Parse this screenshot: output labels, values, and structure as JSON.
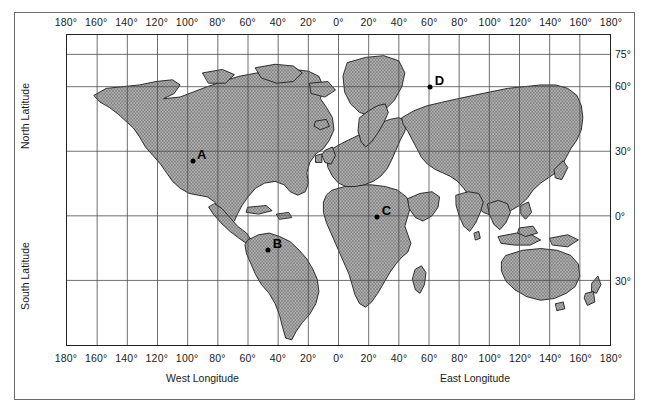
{
  "figure": {
    "type": "world-map",
    "projection": "equirectangular",
    "background_color": "#ffffff",
    "land_fill_color": "#9a9a9a",
    "land_outline_color": "#1a1a1a",
    "grid_color": "#4d4d4d",
    "frame_color": "#6b6b6b"
  },
  "axes": {
    "x": {
      "west_title": "West Longitude",
      "east_title": "East Longitude",
      "ticks": [
        {
          "label": "180°",
          "value": -180
        },
        {
          "label": "160°",
          "value": -160
        },
        {
          "label": "140°",
          "value": -140
        },
        {
          "label": "120°",
          "value": -120
        },
        {
          "label": "100°",
          "value": -100
        },
        {
          "label": "80°",
          "value": -80
        },
        {
          "label": "60°",
          "value": -60
        },
        {
          "label": "40°",
          "value": -40
        },
        {
          "label": "20°",
          "value": -20
        },
        {
          "label": "0°",
          "value": 0
        },
        {
          "label": "20°",
          "value": 20
        },
        {
          "label": "40°",
          "value": 40
        },
        {
          "label": "60°",
          "value": 60
        },
        {
          "label": "80°",
          "value": 80
        },
        {
          "label": "100°",
          "value": 100
        },
        {
          "label": "120°",
          "value": 120
        },
        {
          "label": "140°",
          "value": 140
        },
        {
          "label": "160°",
          "value": 160
        },
        {
          "label": "180°",
          "value": 180
        }
      ],
      "range": [
        -180,
        180
      ],
      "tick_interval": 20
    },
    "y": {
      "north_title": "North Latitude",
      "south_title": "South Latitude",
      "ticks": [
        {
          "label": "75°",
          "value": 75
        },
        {
          "label": "60°",
          "value": 60
        },
        {
          "label": "30°",
          "value": 30
        },
        {
          "label": "0°",
          "value": 0
        },
        {
          "label": "30°",
          "value": -30
        }
      ],
      "range": [
        -60,
        84
      ],
      "grid_interval": 30
    }
  },
  "points": [
    {
      "id": "A",
      "label": "A",
      "lon": -97,
      "lat": 26,
      "region": "Gulf of Mexico / southern North America"
    },
    {
      "id": "B",
      "label": "B",
      "lon": -47,
      "lat": -15,
      "region": "Brazil, South America"
    },
    {
      "id": "C",
      "label": "C",
      "lon": 25,
      "lat": 0,
      "region": "Central Africa"
    },
    {
      "id": "D",
      "label": "D",
      "lon": 60,
      "lat": 60,
      "region": "Siberia, Russia"
    }
  ]
}
